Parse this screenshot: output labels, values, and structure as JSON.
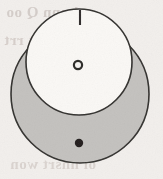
{
  "figure": {
    "kind": "geometric-diagram",
    "canvas": {
      "width": 163,
      "height": 179
    },
    "background_color": "#f2efec",
    "paper_note": "scanned book page with show-through text from the reverse side",
    "outer_circle": {
      "name": "outer-circle",
      "cx": 80,
      "cy": 94,
      "r": 69,
      "fill_color": "#c3c1be",
      "stroke_color": "#32302e",
      "stroke_width": 1.6
    },
    "inner_circle": {
      "name": "inner-circle",
      "cx": 79,
      "cy": 62,
      "r": 53,
      "fill_color": "#faf8f5",
      "stroke_color": "#32302e",
      "stroke_width": 1.6
    },
    "open_point": {
      "name": "open-point-marker",
      "cx": 78,
      "cy": 65,
      "r": 4.1,
      "fill_color": "#f7f5f2",
      "stroke_color": "#2c2a28",
      "stroke_width": 2.2
    },
    "filled_point": {
      "name": "filled-point-marker",
      "cx": 79,
      "cy": 143,
      "r": 4.2,
      "fill_color": "#201e1d"
    },
    "top_tick": {
      "name": "top-tick-mark",
      "x": 80,
      "y1": 10,
      "y2": 25,
      "stroke_color": "#2e2c2a",
      "stroke_width": 2.1
    },
    "bleed_through_text": {
      "line1": "o bunn Q oo",
      "line2": "ionsrmk rrt",
      "line3": "nuv ra q",
      "line4": "oiln ra",
      "line5": "ol nnsrt won"
    }
  }
}
